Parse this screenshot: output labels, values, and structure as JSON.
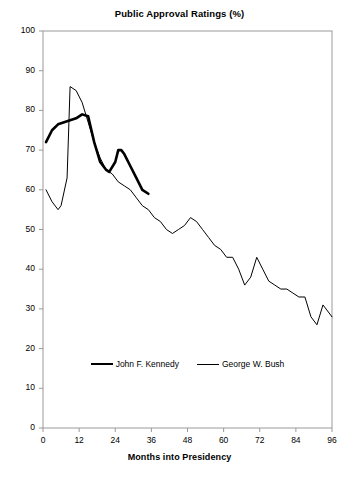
{
  "chart_data": {
    "type": "line",
    "title": "Public Approval Ratings (%)",
    "xlabel": "Months into Presidency",
    "ylabel": "",
    "xlim": [
      0,
      96
    ],
    "ylim": [
      0,
      100
    ],
    "xticks": [
      0,
      12,
      24,
      36,
      48,
      60,
      72,
      84,
      96
    ],
    "yticks": [
      0,
      10,
      20,
      30,
      40,
      50,
      60,
      70,
      80,
      90,
      100
    ],
    "grid": false,
    "legend_position": "below-plot",
    "series": [
      {
        "name": "John F. Kennedy",
        "color": "#000000",
        "line_width": 2.6,
        "points": [
          [
            1,
            72
          ],
          [
            3,
            75
          ],
          [
            5,
            76.5
          ],
          [
            7,
            77
          ],
          [
            9,
            77.5
          ],
          [
            11,
            78
          ],
          [
            13,
            79
          ],
          [
            15,
            78.5
          ],
          [
            17,
            72
          ],
          [
            19,
            67
          ],
          [
            21,
            65
          ],
          [
            22,
            64.5
          ],
          [
            24,
            67
          ],
          [
            25,
            70
          ],
          [
            26,
            70
          ],
          [
            27,
            69
          ],
          [
            29,
            66
          ],
          [
            31,
            63
          ],
          [
            33,
            60
          ],
          [
            35,
            59
          ]
        ]
      },
      {
        "name": "George W. Bush",
        "color": "#000000",
        "line_width": 1,
        "points": [
          [
            1,
            60
          ],
          [
            3,
            57
          ],
          [
            5,
            55
          ],
          [
            6,
            56
          ],
          [
            8,
            63
          ],
          [
            9,
            86
          ],
          [
            11,
            85
          ],
          [
            13,
            82
          ],
          [
            15,
            77
          ],
          [
            17,
            72
          ],
          [
            19,
            68
          ],
          [
            21,
            65
          ],
          [
            23,
            64
          ],
          [
            25,
            62
          ],
          [
            27,
            61
          ],
          [
            29,
            60
          ],
          [
            31,
            58
          ],
          [
            33,
            56
          ],
          [
            35,
            55
          ],
          [
            37,
            53
          ],
          [
            39,
            52
          ],
          [
            41,
            50
          ],
          [
            43,
            49
          ],
          [
            45,
            50
          ],
          [
            47,
            51
          ],
          [
            49,
            53
          ],
          [
            51,
            52
          ],
          [
            53,
            50
          ],
          [
            55,
            48
          ],
          [
            57,
            46
          ],
          [
            59,
            45
          ],
          [
            61,
            43
          ],
          [
            63,
            43
          ],
          [
            65,
            40
          ],
          [
            67,
            36
          ],
          [
            69,
            38
          ],
          [
            71,
            43
          ],
          [
            73,
            40
          ],
          [
            75,
            37
          ],
          [
            77,
            36
          ],
          [
            79,
            35
          ],
          [
            81,
            35
          ],
          [
            83,
            34
          ],
          [
            85,
            33
          ],
          [
            87,
            33
          ],
          [
            89,
            28
          ],
          [
            91,
            26
          ],
          [
            93,
            31
          ],
          [
            96,
            28
          ]
        ]
      }
    ]
  },
  "legend": {
    "items": [
      {
        "label": "John F. Kennedy",
        "style": "thick"
      },
      {
        "label": "George W. Bush",
        "style": "thin"
      }
    ]
  }
}
